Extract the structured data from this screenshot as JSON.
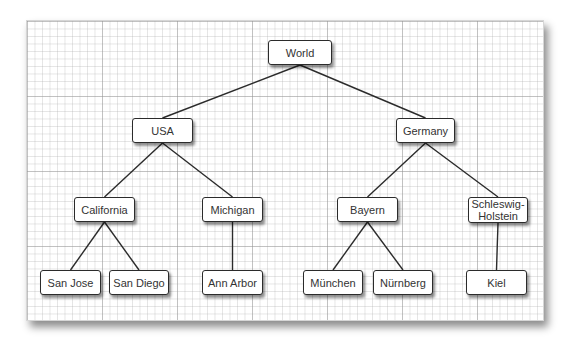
{
  "diagram": {
    "type": "tree",
    "colors": {
      "edge": "#2b2b2b",
      "node_border": "#2b2b2b",
      "node_fill": "#ffffff",
      "text": "#333333",
      "grid": "#c8c8c8"
    },
    "nodes": {
      "world": {
        "label": "World",
        "x": 268,
        "y": 40,
        "w": 64,
        "h": 25
      },
      "usa": {
        "label": "USA",
        "x": 132,
        "y": 118,
        "w": 61,
        "h": 25
      },
      "germany": {
        "label": "Germany",
        "x": 396,
        "y": 118,
        "w": 59,
        "h": 25
      },
      "california": {
        "label": "California",
        "x": 74,
        "y": 197,
        "w": 61,
        "h": 25
      },
      "michigan": {
        "label": "Michigan",
        "x": 202,
        "y": 197,
        "w": 61,
        "h": 25
      },
      "bayern": {
        "label": "Bayern",
        "x": 337,
        "y": 197,
        "w": 61,
        "h": 25
      },
      "schleswig_holstein": {
        "label": "Schleswig-\nHolstein",
        "x": 468,
        "y": 197,
        "w": 60,
        "h": 26
      },
      "san_jose": {
        "label": "San Jose",
        "x": 40,
        "y": 270,
        "w": 61,
        "h": 25
      },
      "san_diego": {
        "label": "San Diego",
        "x": 109,
        "y": 270,
        "w": 60,
        "h": 25
      },
      "ann_arbor": {
        "label": "Ann Arbor",
        "x": 202,
        "y": 270,
        "w": 61,
        "h": 25
      },
      "munchen": {
        "label": "München",
        "x": 303,
        "y": 270,
        "w": 60,
        "h": 25
      },
      "nurnberg": {
        "label": "Nürnberg",
        "x": 373,
        "y": 270,
        "w": 60,
        "h": 25
      },
      "kiel": {
        "label": "Kiel",
        "x": 466,
        "y": 270,
        "w": 61,
        "h": 25
      }
    },
    "edges": [
      {
        "from": "world",
        "to": "usa"
      },
      {
        "from": "world",
        "to": "germany"
      },
      {
        "from": "usa",
        "to": "california"
      },
      {
        "from": "usa",
        "to": "michigan"
      },
      {
        "from": "germany",
        "to": "bayern"
      },
      {
        "from": "germany",
        "to": "schleswig_holstein"
      },
      {
        "from": "california",
        "to": "san_jose"
      },
      {
        "from": "california",
        "to": "san_diego"
      },
      {
        "from": "michigan",
        "to": "ann_arbor"
      },
      {
        "from": "bayern",
        "to": "munchen"
      },
      {
        "from": "bayern",
        "to": "nurnberg"
      },
      {
        "from": "schleswig_holstein",
        "to": "kiel"
      }
    ]
  }
}
